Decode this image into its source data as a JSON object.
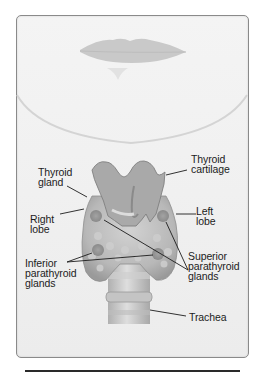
{
  "figure": {
    "labels": {
      "thyroid_gland": "Thyroid\ngland",
      "thyroid_cartilage": "Thyroid\ncartilage",
      "right_lobe": "Right\nlobe",
      "left_lobe": "Left\nlobe",
      "inferior_parathyroid": "Inferior\nparathyroid\nglands",
      "superior_parathyroid": "Superior\nparathyroid\nglands",
      "trachea": "Trachea"
    },
    "colors": {
      "background": "#f2f2f2",
      "tissue": "#b9b9b9",
      "tissue_dark": "#8c8c8c",
      "text": "#1c1c1c",
      "frame_border": "#8a8a8a"
    }
  }
}
